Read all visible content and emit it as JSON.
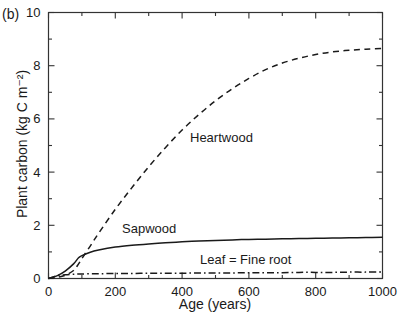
{
  "panel": {
    "label": "(b)"
  },
  "chart_data": {
    "type": "line",
    "title": "",
    "xlabel": "Age (years)",
    "ylabel": "Plant carbon (kg C m⁻²)",
    "xlim": [
      0,
      1000
    ],
    "ylim": [
      0,
      10
    ],
    "xticks": [
      0,
      200,
      400,
      600,
      800,
      1000
    ],
    "xtick_labels": [
      "0",
      "200",
      "400",
      "600",
      "800",
      "1000"
    ],
    "xminor_ticks": [
      100,
      300,
      500,
      700,
      900
    ],
    "yticks": [
      0,
      2,
      4,
      6,
      8,
      10
    ],
    "ytick_labels": [
      "0",
      "2",
      "4",
      "6",
      "8",
      "10"
    ],
    "yminor_ticks": [
      1,
      3,
      5,
      7,
      9
    ],
    "grid": false,
    "legend": "inline-annotations",
    "x": [
      0,
      25,
      50,
      75,
      90,
      100,
      125,
      150,
      200,
      250,
      300,
      350,
      400,
      450,
      500,
      550,
      600,
      650,
      700,
      750,
      800,
      850,
      900,
      950,
      1000
    ],
    "series": [
      {
        "name": "Heartwood",
        "style": "dashed",
        "color": "#1a1a1a",
        "label_text": "Heartwood",
        "values": [
          0.0,
          0.04,
          0.12,
          0.3,
          0.55,
          0.75,
          1.22,
          1.7,
          2.6,
          3.42,
          4.2,
          4.92,
          5.58,
          6.16,
          6.68,
          7.13,
          7.52,
          7.85,
          8.1,
          8.28,
          8.42,
          8.52,
          8.58,
          8.62,
          8.65
        ]
      },
      {
        "name": "Sapwood",
        "style": "solid",
        "color": "#1a1a1a",
        "label_text": "Sapwood",
        "values": [
          0.0,
          0.1,
          0.28,
          0.55,
          0.78,
          0.86,
          0.99,
          1.07,
          1.18,
          1.25,
          1.3,
          1.34,
          1.38,
          1.41,
          1.43,
          1.45,
          1.47,
          1.48,
          1.49,
          1.5,
          1.51,
          1.52,
          1.53,
          1.54,
          1.55
        ]
      },
      {
        "name": "Leaf = Fine root",
        "style": "dash-dot",
        "color": "#1a1a1a",
        "label_text": "Leaf  =  Fine root",
        "values": [
          0.0,
          0.1,
          0.14,
          0.16,
          0.17,
          0.17,
          0.18,
          0.18,
          0.19,
          0.19,
          0.2,
          0.2,
          0.2,
          0.21,
          0.21,
          0.21,
          0.22,
          0.22,
          0.22,
          0.23,
          0.23,
          0.23,
          0.24,
          0.24,
          0.25
        ]
      }
    ]
  }
}
